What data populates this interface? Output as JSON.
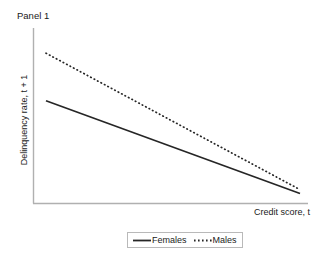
{
  "chart_data": {
    "type": "line",
    "title": "Panel 1",
    "xlabel": "Credit score, t",
    "ylabel": "Delinquency rate, t + 1",
    "grid": false,
    "legend_position": "bottom-center",
    "axis_ticks": "none",
    "axis_tick_labels": "none",
    "xlim": [
      0,
      1
    ],
    "ylim": [
      0,
      1
    ],
    "x": [
      0,
      1
    ],
    "series": [
      {
        "name": "Females",
        "label": "Females",
        "linestyle": "solid",
        "color": "#262626",
        "values": [
          0.612,
          0.057
        ],
        "note": "Solid line: lower intercept, shallower negative slope"
      },
      {
        "name": "Males",
        "label": "Males",
        "linestyle": "dotted",
        "color": "#262626",
        "values": [
          0.897,
          0.08
        ],
        "note": "Dotted line: higher intercept, steeper negative slope; converges toward the solid line at high credit score"
      }
    ],
    "annotations": []
  },
  "figure": {
    "title": "Panel 1",
    "background_color": "#ffffff",
    "axis_color": "#b0b0b0",
    "line_color": "#262626",
    "legend_border_color": "#b9b9b9"
  },
  "axes": {
    "y_label": "Delinquency rate, t + 1",
    "x_label": "Credit score, t"
  },
  "legend": {
    "items": [
      {
        "label": "Females",
        "style": "solid",
        "icon": "solid-line-swatch"
      },
      {
        "label": "Males",
        "style": "dotted",
        "icon": "dotted-line-swatch"
      }
    ]
  }
}
